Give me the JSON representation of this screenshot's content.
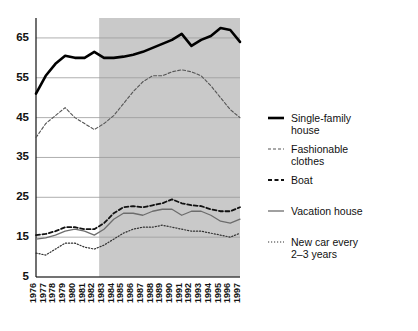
{
  "chart_data": {
    "type": "line",
    "title": "",
    "subtitle": "",
    "xlabel": "",
    "ylabel": "",
    "grid": true,
    "legend_position": "right",
    "ylim": [
      5,
      70
    ],
    "yticks": [
      5,
      15,
      25,
      35,
      45,
      55,
      65
    ],
    "x": [
      1976,
      1977,
      1978,
      1979,
      1980,
      1981,
      1982,
      1983,
      1984,
      1985,
      1986,
      1987,
      1988,
      1989,
      1990,
      1991,
      1992,
      1993,
      1994,
      1995,
      1996,
      1997
    ],
    "xticklabels": [
      "1976",
      "1977",
      "1978",
      "1979",
      "1980",
      "1981",
      "1982",
      "1983",
      "1984",
      "1985",
      "1986",
      "1987",
      "1988",
      "1989",
      "1990",
      "1991",
      "1992",
      "1993",
      "1994",
      "1995",
      "1996",
      "1997"
    ],
    "shaded_region": {
      "from": 1982,
      "to": 1997,
      "color": "#c9c9c9",
      "label": ""
    },
    "series": [
      {
        "name": "Single-family house",
        "style": "solid-thick",
        "color": "#000000",
        "values": [
          51.0,
          55.5,
          58.5,
          60.5,
          60.0,
          60.0,
          61.5,
          60.0,
          60.0,
          60.3,
          60.8,
          61.5,
          62.5,
          63.5,
          64.5,
          66.0,
          63.0,
          64.5,
          65.5,
          67.5,
          67.0,
          64.0
        ]
      },
      {
        "name": "Fashionable clothes",
        "style": "dashed-thin",
        "color": "#555555",
        "values": [
          40.0,
          43.5,
          45.5,
          47.5,
          45.0,
          43.5,
          42.0,
          43.5,
          45.5,
          48.5,
          51.5,
          54.0,
          55.5,
          55.5,
          56.5,
          57.0,
          56.5,
          55.5,
          53.0,
          50.0,
          47.0,
          45.0
        ]
      },
      {
        "name": "Boat",
        "style": "dashed-medium",
        "color": "#111111",
        "values": [
          15.5,
          15.8,
          16.5,
          17.5,
          17.5,
          17.0,
          17.0,
          18.5,
          21.0,
          22.5,
          22.8,
          22.5,
          23.0,
          23.5,
          24.5,
          23.5,
          23.0,
          22.8,
          22.0,
          21.5,
          21.5,
          22.5
        ]
      },
      {
        "name": "Vacation house",
        "style": "solid-thin",
        "color": "#6d6d6d",
        "values": [
          14.5,
          14.8,
          15.5,
          16.5,
          17.0,
          16.5,
          15.5,
          17.0,
          19.5,
          21.0,
          21.0,
          20.5,
          21.5,
          22.0,
          22.0,
          20.5,
          21.5,
          21.5,
          20.5,
          19.0,
          18.5,
          19.5
        ]
      },
      {
        "name": "New car every 2–3 years",
        "style": "dotted",
        "color": "#333333",
        "values": [
          11.0,
          10.5,
          12.0,
          13.5,
          13.5,
          12.5,
          12.0,
          13.0,
          14.5,
          16.0,
          17.0,
          17.5,
          17.5,
          18.0,
          17.5,
          17.0,
          16.5,
          16.5,
          16.0,
          15.5,
          15.0,
          16.0
        ]
      }
    ]
  },
  "legend": {
    "items": [
      {
        "label_line1": "Single-family",
        "label_line2": "house",
        "style": "solid-thick"
      },
      {
        "label_line1": "Fashionable",
        "label_line2": "clothes",
        "style": "dashed-thin"
      },
      {
        "label_line1": "Boat",
        "label_line2": "",
        "style": "dashed-medium"
      },
      {
        "label_line1": "Vacation house",
        "label_line2": "",
        "style": "solid-thin"
      },
      {
        "label_line1": "New car every",
        "label_line2": "2–3 years",
        "style": "dotted"
      }
    ]
  }
}
